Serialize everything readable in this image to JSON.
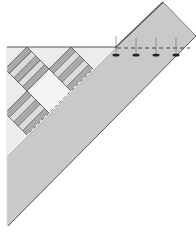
{
  "diagram": {
    "type": "quilt-binding-corner-illustration",
    "colors": {
      "background": "#ffffff",
      "quilt_top": "#ececec",
      "binding_strip": "#c9c9c9",
      "outline": "#555555",
      "stripe_dark": "#a9a9a9",
      "stripe_light": "#dcdcdc",
      "center_square": "#f4f4f4",
      "marker": "#222222"
    },
    "elements": {
      "blocks": [
        {
          "name": "striped-block-top-left"
        },
        {
          "name": "striped-block-top-right"
        },
        {
          "name": "center-square"
        },
        {
          "name": "striped-block-bottom-left"
        }
      ],
      "markers": [
        {
          "name": "pin-marker-1",
          "x": 117
        },
        {
          "name": "pin-marker-2",
          "x": 137
        },
        {
          "name": "pin-marker-3",
          "x": 157
        },
        {
          "name": "pin-marker-4",
          "x": 177
        }
      ]
    }
  }
}
